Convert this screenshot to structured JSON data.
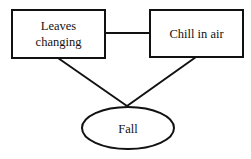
{
  "diagram": {
    "nodes": [
      {
        "id": "leaves",
        "shape": "rectangle",
        "lines": [
          "Leaves",
          "changing"
        ]
      },
      {
        "id": "chill",
        "shape": "rectangle",
        "lines": [
          "Chill in air"
        ]
      },
      {
        "id": "fall",
        "shape": "ellipse",
        "lines": [
          "Fall"
        ]
      }
    ],
    "edges": [
      {
        "from": "leaves",
        "to": "chill"
      },
      {
        "from": "leaves",
        "to": "fall"
      },
      {
        "from": "chill",
        "to": "fall"
      }
    ],
    "colors": {
      "stroke": "#111111",
      "background": "#ffffff"
    }
  }
}
